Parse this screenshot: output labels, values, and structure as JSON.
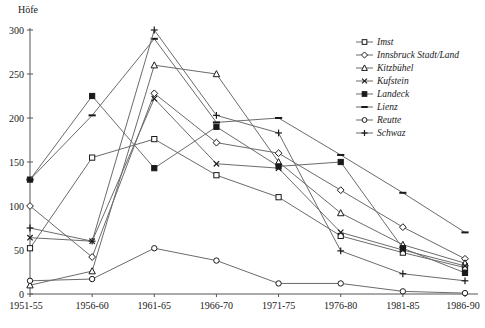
{
  "figure": {
    "background": "#ffffff"
  },
  "chart_data": {
    "type": "line",
    "title": "",
    "ylabel": "Höfe",
    "xlabel": "",
    "ylim": [
      0,
      300
    ],
    "ytick_step": 50,
    "ytick_labels": [
      "0",
      "50",
      "100",
      "150",
      "200",
      "250",
      "300"
    ],
    "grid": false,
    "legend_position": "upper-right-inside",
    "categories": [
      "1951-55",
      "1956-60",
      "1961-65",
      "1966-70",
      "1971-75",
      "1976-80",
      "1981-85",
      "1986-90"
    ],
    "series": [
      {
        "name": "Imst",
        "marker": "square-open",
        "values": [
          52,
          155,
          176,
          135,
          110,
          66,
          47,
          30
        ]
      },
      {
        "name": "Innsbruck Stadt/Land",
        "marker": "diamond-open",
        "values": [
          100,
          42,
          228,
          172,
          160,
          118,
          76,
          40
        ]
      },
      {
        "name": "Kitzbühel",
        "marker": "triangle-open",
        "values": [
          10,
          26,
          260,
          250,
          150,
          92,
          56,
          35
        ]
      },
      {
        "name": "Kufstein",
        "marker": "x",
        "values": [
          64,
          60,
          222,
          148,
          143,
          70,
          50,
          32
        ]
      },
      {
        "name": "Landeck",
        "marker": "square-filled",
        "values": [
          130,
          225,
          143,
          190,
          145,
          150,
          52,
          24
        ]
      },
      {
        "name": "Lienz",
        "marker": "dash",
        "values": [
          130,
          203,
          290,
          195,
          200,
          158,
          115,
          70
        ]
      },
      {
        "name": "Reutte",
        "marker": "circle-open",
        "values": [
          15,
          17,
          52,
          38,
          12,
          12,
          3,
          1
        ]
      },
      {
        "name": "Schwaz",
        "marker": "plus",
        "values": [
          75,
          60,
          300,
          203,
          183,
          49,
          23,
          15
        ]
      }
    ]
  },
  "colors": {
    "line": "#6b6b6b",
    "marker": "#1a1a1a",
    "axis": "#555555",
    "text": "#1a1a1a",
    "background": "#ffffff"
  }
}
